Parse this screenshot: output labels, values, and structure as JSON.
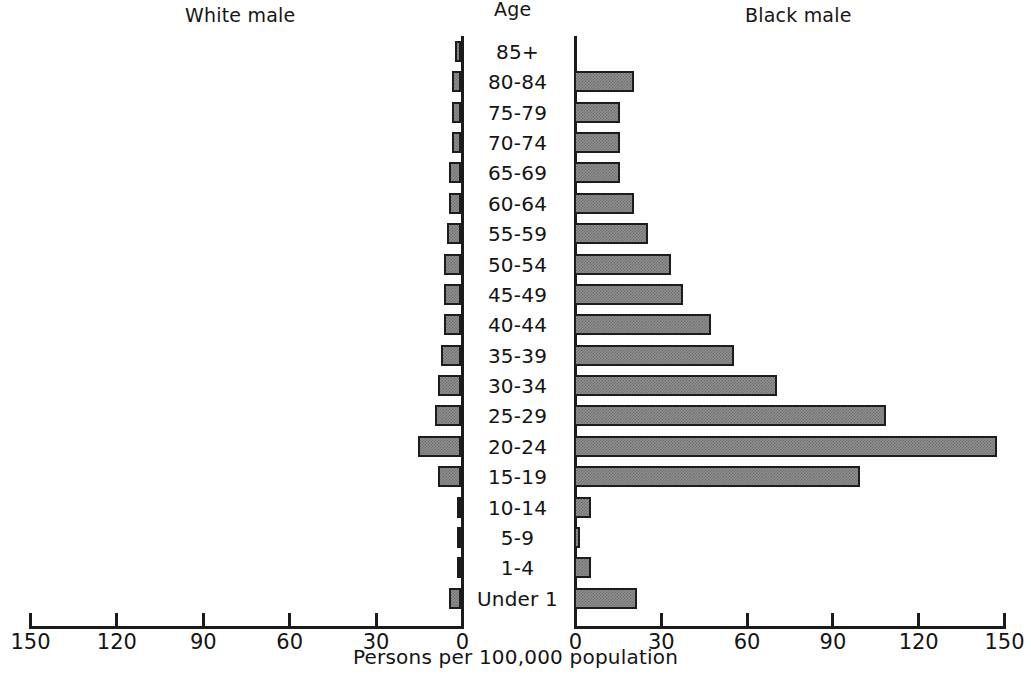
{
  "headings": {
    "left_panel": "White male",
    "center": "Age",
    "right_panel": "Black male"
  },
  "axis": {
    "xlabel": "Persons per 100,000 population",
    "ticks": [
      0,
      30,
      60,
      90,
      120,
      150
    ],
    "left_tick_labels": [
      "150",
      "120",
      "90",
      "60",
      "30",
      "0"
    ],
    "right_tick_labels": [
      "0",
      "30",
      "60",
      "90",
      "120",
      "150"
    ],
    "max": 150
  },
  "chart_data": {
    "type": "bar",
    "orientation": "horizontal",
    "layout": "population-pyramid",
    "xlabel": "Persons per 100,000 population",
    "ylabel": "Age",
    "xlim": [
      0,
      150
    ],
    "grid": false,
    "legend": false,
    "categories": [
      "85+",
      "80-84",
      "75-79",
      "70-74",
      "65-69",
      "60-64",
      "55-59",
      "50-54",
      "45-49",
      "40-44",
      "35-39",
      "30-34",
      "25-29",
      "20-24",
      "15-19",
      "10-14",
      "5-9",
      "1-4",
      "Under 1"
    ],
    "series": [
      {
        "name": "White male",
        "side": "left",
        "values": [
          2,
          3,
          3,
          3,
          4,
          4,
          5,
          6,
          6,
          6,
          7,
          8,
          9,
          15,
          8,
          1,
          1,
          1,
          4
        ]
      },
      {
        "name": "Black male",
        "side": "right",
        "values": [
          0,
          21,
          16,
          16,
          16,
          21,
          26,
          34,
          38,
          48,
          56,
          71,
          109,
          148,
          100,
          6,
          2,
          6,
          22
        ]
      }
    ]
  },
  "style": {
    "bar_fill": "#8e8e8e",
    "bar_pattern": "#707070",
    "bar_border": "#1c1c1c",
    "axis_color": "#1b1b1b",
    "text_color": "#141414",
    "background": "#ffffff"
  }
}
